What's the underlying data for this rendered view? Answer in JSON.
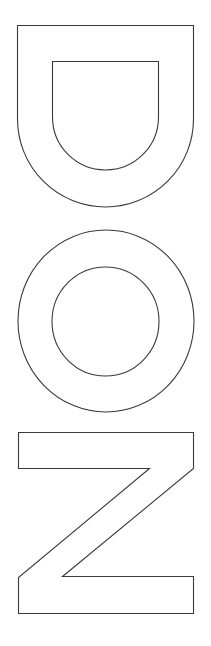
{
  "image": {
    "description": "Outlined block letters stacked vertically for coloring",
    "letters": [
      {
        "char": "D",
        "orientation": "rotated 90deg (opening up)"
      },
      {
        "char": "O",
        "orientation": "upright"
      },
      {
        "char": "N",
        "orientation": "rotated 90deg (appears as Z)"
      }
    ],
    "word": "DON",
    "colors": {
      "background": "#ffffff",
      "stroke": "#3a3a3a"
    }
  }
}
